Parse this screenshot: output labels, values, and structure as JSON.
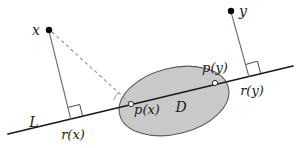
{
  "figure": {
    "type": "geometry-diagram",
    "background_color": "#ffffff",
    "line_color": "#1a1a1a",
    "thin_line_color": "#6e6e6e",
    "dashed_line_color": "#8a8a8a",
    "region_fill_color": "#c9c9c9",
    "region_stroke_color": "#5a5a5a",
    "point_color": "#000000",
    "labels": {
      "x": "x",
      "y": "y",
      "line": "L",
      "region": "D",
      "proj_x": "p(x)",
      "proj_y": "p(y)",
      "foot_x": "r(x)",
      "foot_y": "r(y)"
    },
    "points": {
      "x": {
        "cx": 49,
        "cy": 30,
        "r": 3.2
      },
      "y": {
        "cx": 231,
        "cy": 11,
        "r": 3.2
      },
      "proj_x": {
        "cx": 131,
        "cy": 104,
        "r": 2.6
      },
      "proj_y": {
        "cx": 215,
        "cy": 83,
        "r": 2.6
      },
      "foot_x": {
        "cx": 71,
        "cy": 119,
        "r": 0
      },
      "foot_y": {
        "cx": 249,
        "cy": 76,
        "r": 0
      }
    },
    "line_L": {
      "x1": 8,
      "y1": 134,
      "x2": 293,
      "y2": 66
    },
    "segments": {
      "x_to_foot": {
        "x1": 49,
        "y1": 30,
        "x2": 71,
        "y2": 119
      },
      "y_to_foot": {
        "x1": 231,
        "y1": 11,
        "x2": 249,
        "y2": 76
      },
      "x_to_projx": {
        "x1": 51,
        "y1": 32,
        "x2": 130,
        "y2": 103
      }
    },
    "ellipse": {
      "cx": 174,
      "cy": 101,
      "rx": 56,
      "ry": 33,
      "rotation_deg": -14
    },
    "right_angle_marks": [
      {
        "at": "r(x)",
        "size": 12
      },
      {
        "at": "r(y)",
        "size": 12
      }
    ],
    "angle_arc": {
      "at": "p(x)",
      "radius": 17
    }
  }
}
